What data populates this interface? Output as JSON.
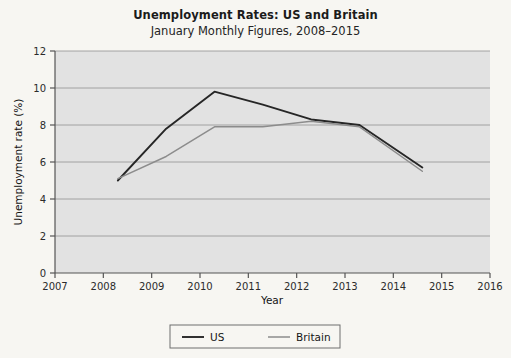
{
  "chart_data": {
    "type": "line",
    "title": "Unemployment Rates: US and Britain",
    "subtitle": "January Monthly Figures, 2008–2015",
    "xlabel": "Year",
    "ylabel": "Unemployment rate (%)",
    "xlim": [
      2007,
      2016
    ],
    "ylim": [
      0,
      12
    ],
    "xticks": [
      2007,
      2008,
      2009,
      2010,
      2011,
      2012,
      2013,
      2014,
      2015,
      2016
    ],
    "xtick_labels": [
      "2007",
      "2008",
      "2009",
      "2010",
      "2011",
      "2012",
      "2013",
      "2014",
      "2015",
      "2016"
    ],
    "yticks": [
      0,
      2,
      4,
      6,
      8,
      10,
      12
    ],
    "ytick_labels": [
      "0",
      "2",
      "4",
      "6",
      "8",
      "10",
      "12"
    ],
    "grid": "horizontal",
    "legend_position": "bottom-center",
    "plot_background": "#e2e2e2",
    "figure_background": "#f7f6f2",
    "gridline_color": "#9a9a9a",
    "x": [
      2008.3,
      2009.3,
      2010.3,
      2011.3,
      2012.3,
      2013.3,
      2014.6
    ],
    "series": [
      {
        "name": "US",
        "color": "#262626",
        "values": [
          5.0,
          7.8,
          9.8,
          9.1,
          8.3,
          8.0,
          5.7
        ]
      },
      {
        "name": "Britain",
        "color": "#8c8c8c",
        "values": [
          5.1,
          6.3,
          7.9,
          7.9,
          8.2,
          7.9,
          5.5
        ]
      }
    ]
  },
  "legend": {
    "items": [
      {
        "label": "US",
        "color": "#262626"
      },
      {
        "label": "Britain",
        "color": "#8c8c8c"
      }
    ]
  }
}
